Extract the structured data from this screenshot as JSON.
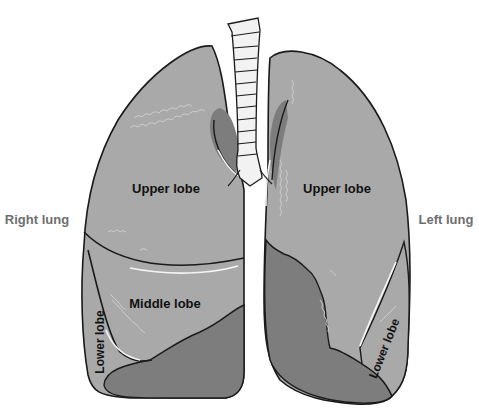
{
  "diagram": {
    "side_labels": {
      "right": "Right lung",
      "left": "Left lung"
    },
    "right_lung": {
      "lobes": [
        "Upper lobe",
        "Middle lobe",
        "Lower lobe"
      ]
    },
    "left_lung": {
      "lobes": [
        "Upper lobe",
        "Lower lobe"
      ]
    },
    "colors": {
      "lobe_light": "#a9a9a9",
      "lobe_dark": "#7d7d7d",
      "outline": "#1a1a1a",
      "trachea": "#f2f2f2",
      "side_label_text": "#6e6e6e",
      "lobe_label_text": "#111111"
    }
  }
}
